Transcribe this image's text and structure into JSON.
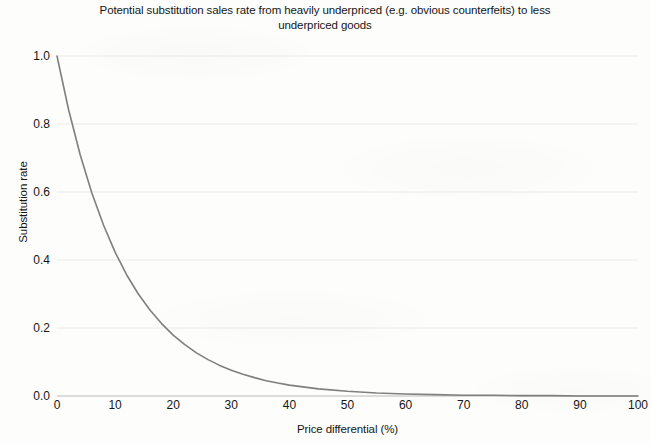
{
  "chart_data": {
    "type": "line",
    "title": "Potential substitution sales rate from heavily underpriced (e.g. obvious counterfeits) to less underpriced goods",
    "title_line_1": "Potential substitution sales rate from heavily underpriced (e.g. obvious counterfeits) to",
    "title_line_2": "less underpriced goods",
    "xlabel": "Price differential (%)",
    "ylabel": "Substitution rate",
    "xlim": [
      0,
      100
    ],
    "ylim": [
      0.0,
      1.0
    ],
    "xticks": [
      "0",
      "10",
      "20",
      "30",
      "40",
      "50",
      "60",
      "70",
      "80",
      "90",
      "100"
    ],
    "yticks": [
      "0.0",
      "0.2",
      "0.4",
      "0.6",
      "0.8",
      "1.0"
    ],
    "grid": "horizontal",
    "legend": "none",
    "line_color": "#7f7f7f",
    "series": [
      {
        "name": "Substitution rate",
        "x": [
          0,
          2,
          4,
          6,
          8,
          10,
          12,
          14,
          16,
          18,
          20,
          22,
          24,
          26,
          28,
          30,
          32,
          34,
          36,
          38,
          40,
          45,
          50,
          55,
          60,
          65,
          70,
          75,
          80,
          85,
          90,
          95,
          100
        ],
        "values": [
          1.0,
          0.842,
          0.709,
          0.597,
          0.503,
          0.423,
          0.356,
          0.3,
          0.253,
          0.213,
          0.179,
          0.151,
          0.127,
          0.107,
          0.09,
          0.076,
          0.064,
          0.054,
          0.045,
          0.038,
          0.032,
          0.021,
          0.014,
          0.009,
          0.006,
          0.004,
          0.002,
          0.002,
          0.001,
          0.001,
          0.0,
          0.0,
          0.0
        ]
      }
    ]
  },
  "axis": {
    "y_tick_values": [
      "1.0",
      "0.8",
      "0.6",
      "0.4",
      "0.2",
      "0.0"
    ],
    "x_tick_values": [
      "0",
      "10",
      "20",
      "30",
      "40",
      "50",
      "60",
      "70",
      "80",
      "90",
      "100"
    ]
  }
}
